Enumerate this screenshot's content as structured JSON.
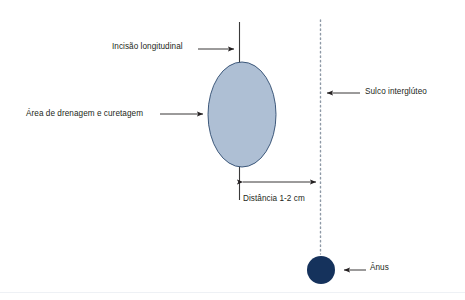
{
  "diagram": {
    "background_color": "#ffffff",
    "labels": {
      "incision": "Incisão longitudinal",
      "drainage_area": "Área de drenagem e curetagem",
      "intergluteal_sulcus": "Sulco interglúteo",
      "distance": "Distância 1-2 cm",
      "anus": "Ânus"
    },
    "shapes": {
      "lesion_ellipse": {
        "name": "drainage-and-curettage-area",
        "fill": "#aebfd4",
        "stroke": "#2c4a6e",
        "cx": 242,
        "cy": 114.5,
        "rx": 34,
        "ry": 52.5
      },
      "anus_circle": {
        "name": "anus-marker",
        "fill": "#15325c",
        "cx": 321,
        "cy": 270,
        "r": 14
      },
      "incision_line": {
        "name": "longitudinal-incision-line",
        "stroke": "#3a3a3a",
        "x": 239,
        "y_top": 22,
        "y_bottom": 200
      },
      "sulcus_line": {
        "name": "intergluteal-sulcus-line",
        "stroke": "#8e99a6",
        "style": "dotted",
        "x": 320,
        "y_top": 20,
        "y_bottom": 254
      },
      "footer_rule": {
        "name": "footer-divider",
        "stroke": "#eef1f5",
        "y": 292
      }
    },
    "leaders": {
      "incision": {
        "from_x": 198,
        "to_x": 237,
        "y": 49
      },
      "drainage_area": {
        "from_x": 160,
        "to_x": 206,
        "y": 114
      },
      "sulcus": {
        "from_x": 360,
        "to_x": 324,
        "y": 93
      },
      "anus": {
        "from_x": 366,
        "to_x": 341,
        "y": 270
      },
      "distance": {
        "from_x": 239,
        "to_x": 320,
        "y": 182
      }
    },
    "colors": {
      "text": "#231f20",
      "leader": "#231f20",
      "lesion_fill": "#aebfd4",
      "lesion_stroke": "#2c4a6e",
      "anus_fill": "#15325c",
      "incision_stroke": "#3a3a3a",
      "sulcus_stroke": "#8e99a6"
    }
  }
}
